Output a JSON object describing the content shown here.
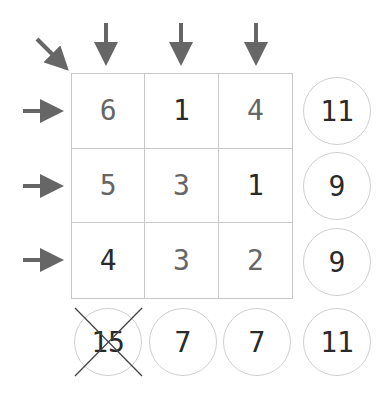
{
  "grid": {
    "cells": [
      {
        "value": "6",
        "tone": "gray"
      },
      {
        "value": "1",
        "tone": "dark"
      },
      {
        "value": "4",
        "tone": "gray"
      },
      {
        "value": "5",
        "tone": "gray"
      },
      {
        "value": "3",
        "tone": "gray"
      },
      {
        "value": "1",
        "tone": "dark"
      },
      {
        "value": "4",
        "tone": "dark"
      },
      {
        "value": "3",
        "tone": "gray"
      },
      {
        "value": "2",
        "tone": "gray"
      }
    ]
  },
  "row_sums": [
    "11",
    "9",
    "9"
  ],
  "column_sums": [
    "7",
    "7"
  ],
  "diagonal_sum": {
    "value": "15",
    "crossed_out": true
  },
  "corner_sum": "11",
  "colors": {
    "arrow": "#666666",
    "grid_line": "#c8c8c8",
    "dark_text": "#2a2a2a",
    "gray_text": "#666666"
  }
}
